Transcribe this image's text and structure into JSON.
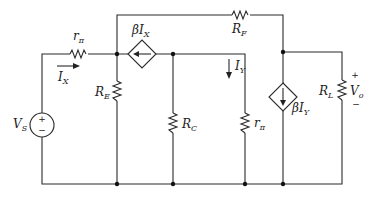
{
  "diagram": {
    "type": "circuit-schematic",
    "components": {
      "source": {
        "name": "V",
        "sub": "S",
        "plus": "+",
        "minus": "−"
      },
      "r_pi_series": {
        "name": "r",
        "sub": "π"
      },
      "ccs_top": {
        "beta": "β",
        "name": "I",
        "sub": "X"
      },
      "r_e": {
        "name": "R",
        "sub": "E"
      },
      "r_c": {
        "name": "R",
        "sub": "C"
      },
      "r_pi_shunt": {
        "name": "r",
        "sub": "π"
      },
      "r_f": {
        "name": "R",
        "sub": "F"
      },
      "ccs_right": {
        "beta": "β",
        "name": "I",
        "sub": "Y"
      },
      "r_l": {
        "name": "R",
        "sub": "L"
      },
      "vo": {
        "name": "V",
        "sub": "o",
        "plus": "+",
        "minus": "−"
      }
    },
    "currents": {
      "ix": {
        "name": "I",
        "sub": "X",
        "direction": "right"
      },
      "iy": {
        "name": "I",
        "sub": "Y",
        "direction": "down"
      }
    }
  }
}
